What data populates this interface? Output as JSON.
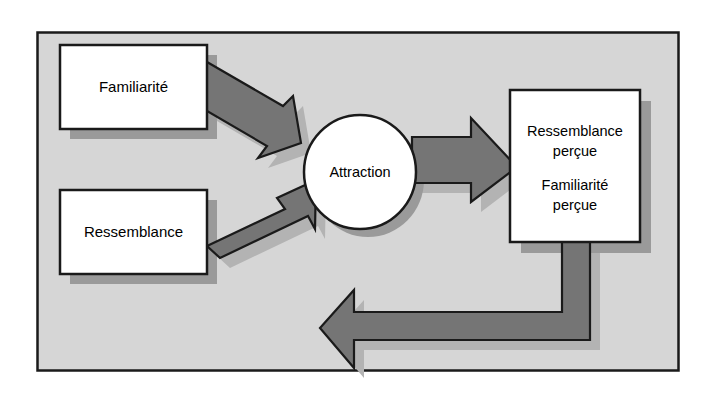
{
  "figure": {
    "type": "flow-diagram",
    "language": "fr",
    "background_color": "#d6d6d6",
    "frame_border_color": "#1a1a1a",
    "page_color": "#ffffff"
  },
  "palette": {
    "node_fill": "#ffffff",
    "node_stroke": "#1a1a1a",
    "arrow_fill": "#757575",
    "arrow_stroke": "#1a1a1a",
    "shadow_color": "#9a9a9a",
    "arrow_shadow_color": "#b5b5b5",
    "text_color": "#000000"
  },
  "nodes": [
    {
      "id": "familiarite",
      "shape": "rectangle",
      "lines": [
        "Familiarité"
      ],
      "x": 60,
      "y": 45,
      "width": 147,
      "height": 84
    },
    {
      "id": "ressemblance",
      "shape": "rectangle",
      "lines": [
        "Ressemblance"
      ],
      "x": 60,
      "y": 190,
      "width": 147,
      "height": 84
    },
    {
      "id": "attraction",
      "shape": "ellipse",
      "lines": [
        "Attraction"
      ],
      "cx": 360,
      "cy": 172,
      "rx": 56,
      "ry": 57
    },
    {
      "id": "percue",
      "shape": "rectangle",
      "lines": [
        "Ressemblance",
        "perçue",
        "Familiarité",
        "perçue"
      ],
      "x": 510,
      "y": 90,
      "width": 130,
      "height": 152
    }
  ],
  "edges": [
    {
      "id": "familiarite-to-attraction",
      "from": "familiarite",
      "to": "attraction",
      "style": "block-arrow",
      "direction": "diagonal-down-right"
    },
    {
      "id": "ressemblance-to-attraction",
      "from": "ressemblance",
      "to": "attraction",
      "style": "block-arrow",
      "direction": "diagonal-up-right"
    },
    {
      "id": "attraction-to-percue",
      "from": "attraction",
      "to": "percue",
      "style": "block-arrow",
      "direction": "right"
    },
    {
      "id": "percue-to-attraction-feedback",
      "from": "percue",
      "to": "attraction",
      "style": "block-arrow-elbow",
      "direction": "down-left-up"
    }
  ]
}
